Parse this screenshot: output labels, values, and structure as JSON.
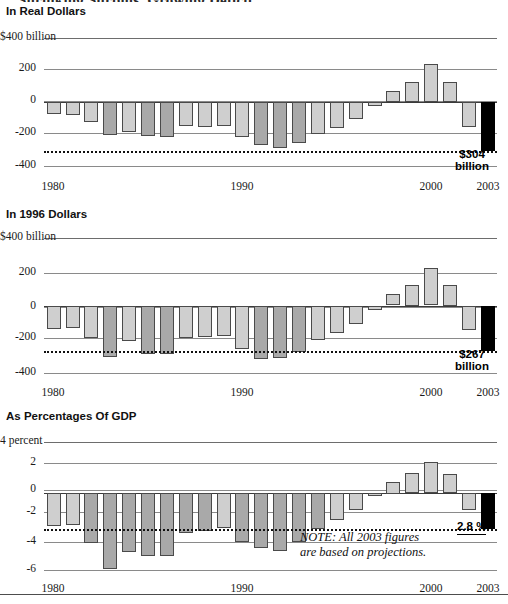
{
  "clipped_header": "Shrinking Surplus, Growing Deficit",
  "panels": [
    {
      "title": "In Real Dollars",
      "y_axis": {
        "top_label": "$400 billion",
        "ticks": [
          "$400 billion",
          "200",
          "0",
          "-200",
          "-400"
        ],
        "values": [
          400,
          200,
          0,
          -200,
          -400
        ]
      },
      "x_axis": {
        "ticks": [
          "1980",
          "1990",
          "2000",
          "2003"
        ]
      },
      "reference_line_value": -304,
      "callout": {
        "line1": "$304",
        "line2": "billion"
      }
    },
    {
      "title": "In 1996 Dollars",
      "y_axis": {
        "top_label": "$400 billion",
        "ticks": [
          "$400 billion",
          "200",
          "0",
          "-200",
          "-400"
        ],
        "values": [
          400,
          200,
          0,
          -200,
          -400
        ]
      },
      "x_axis": {
        "ticks": [
          "1980",
          "1990",
          "2000",
          "2003"
        ]
      },
      "reference_line_value": -267,
      "callout": {
        "line1": "$267",
        "line2": "billion"
      }
    },
    {
      "title": "As Percentages Of GDP",
      "y_axis": {
        "top_label": "4 percent",
        "ticks": [
          "4 percent",
          "2",
          "0",
          "-2",
          "-4",
          "-6"
        ],
        "values": [
          4,
          2,
          0,
          -2,
          -4,
          -6
        ]
      },
      "x_axis": {
        "ticks": [
          "1980",
          "1990",
          "2000",
          "2003"
        ]
      },
      "reference_line_value": -2.8,
      "callout": {
        "line1": "2.8 %",
        "line2": ""
      },
      "note": {
        "line1": "NOTE: All 2003 figures",
        "line2": "are based on projections."
      }
    }
  ],
  "colors": {
    "bar_light": "#cfcfcf",
    "bar_dark": "#a9a9a9",
    "bar_highlight": "#000000",
    "gridline": "#6d6d6d",
    "text": "#1a1a1a"
  },
  "chart_data": [
    {
      "type": "bar",
      "title": "In Real Dollars",
      "xlabel": "",
      "ylabel": "$ billions",
      "ylim": [
        -400,
        400
      ],
      "grid": true,
      "legend": "none",
      "reference_line": -304,
      "categories": [
        "1980",
        "1981",
        "1982",
        "1983",
        "1984",
        "1985",
        "1986",
        "1987",
        "1988",
        "1989",
        "1990",
        "1991",
        "1992",
        "1993",
        "1994",
        "1995",
        "1996",
        "1997",
        "1998",
        "1999",
        "2000",
        "2001",
        "2002",
        "2003"
      ],
      "values": [
        -74,
        -79,
        -128,
        -208,
        -185,
        -212,
        -221,
        -150,
        -155,
        -153,
        -221,
        -269,
        -290,
        -255,
        -203,
        -164,
        -107,
        -22,
        69,
        126,
        236,
        127,
        -158,
        -304
      ],
      "shades": [
        "light",
        "light",
        "light",
        "dark",
        "light",
        "dark",
        "dark",
        "light",
        "light",
        "light",
        "light",
        "dark",
        "dark",
        "dark",
        "light",
        "light",
        "light",
        "light",
        "light",
        "light",
        "light",
        "light",
        "light",
        "black"
      ]
    },
    {
      "type": "bar",
      "title": "In 1996 Dollars",
      "xlabel": "",
      "ylabel": "1996 $ billions",
      "ylim": [
        -400,
        400
      ],
      "grid": true,
      "legend": "none",
      "reference_line": -267,
      "categories": [
        "1980",
        "1981",
        "1982",
        "1983",
        "1984",
        "1985",
        "1986",
        "1987",
        "1988",
        "1989",
        "1990",
        "1991",
        "1992",
        "1993",
        "1994",
        "1995",
        "1996",
        "1997",
        "1998",
        "1999",
        "2000",
        "2001",
        "2002",
        "2003"
      ],
      "values": [
        -135,
        -130,
        -190,
        -300,
        -205,
        -285,
        -282,
        -190,
        -185,
        -178,
        -255,
        -313,
        -310,
        -272,
        -200,
        -160,
        -107,
        -22,
        68,
        122,
        222,
        122,
        -140,
        -267
      ],
      "shades": [
        "light",
        "light",
        "light",
        "dark",
        "light",
        "dark",
        "dark",
        "light",
        "light",
        "light",
        "light",
        "dark",
        "dark",
        "dark",
        "light",
        "light",
        "light",
        "light",
        "light",
        "light",
        "light",
        "light",
        "light",
        "black"
      ]
    },
    {
      "type": "bar",
      "title": "As Percentages Of GDP",
      "xlabel": "",
      "ylabel": "percent of GDP",
      "ylim": [
        -6,
        4
      ],
      "grid": true,
      "legend": "none",
      "reference_line": -2.8,
      "categories": [
        "1980",
        "1981",
        "1982",
        "1983",
        "1984",
        "1985",
        "1986",
        "1987",
        "1988",
        "1989",
        "1990",
        "1991",
        "1992",
        "1993",
        "1994",
        "1995",
        "1996",
        "1997",
        "1998",
        "1999",
        "2000",
        "2001",
        "2002",
        "2003"
      ],
      "values": [
        -2.6,
        -2.5,
        -3.9,
        -5.9,
        -4.6,
        -4.9,
        -4.9,
        -3.1,
        -3.0,
        -2.7,
        -3.8,
        -4.3,
        -4.5,
        -3.8,
        -2.8,
        -2.1,
        -1.3,
        -0.2,
        0.9,
        1.6,
        2.4,
        1.5,
        -1.3,
        -2.8
      ],
      "shades": [
        "light",
        "light",
        "dark",
        "dark",
        "dark",
        "dark",
        "dark",
        "dark",
        "dark",
        "light",
        "dark",
        "dark",
        "dark",
        "dark",
        "dark",
        "light",
        "light",
        "light",
        "light",
        "light",
        "light",
        "light",
        "light",
        "black"
      ]
    }
  ]
}
